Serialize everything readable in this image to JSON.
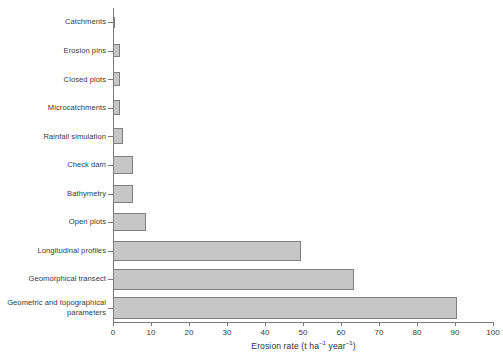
{
  "chart_data": {
    "type": "bar",
    "orientation": "horizontal",
    "title": "",
    "subtitle": "",
    "xlabel": "Erosion rate (t ha⁻¹ year⁻¹)",
    "xlabel_parts": {
      "lead": "Erosion rate (t ha",
      "sup1": "−1",
      "mid": " year",
      "sup2": "−1",
      "tail": ")"
    },
    "ylabel": "",
    "categories": [
      "Catchments",
      "Erosion pins",
      "Closed plots",
      "Microcatchments",
      "Rainfall simulation",
      "Check dam",
      "Bathymetry",
      "Open plots",
      "Longitudinal profiles",
      "Geomorphical transect",
      "Geometric and topographical parameters"
    ],
    "category_lines": [
      [
        "Catchments"
      ],
      [
        "Erosion pins"
      ],
      [
        "Closed plots"
      ],
      [
        "Microcatchments"
      ],
      [
        "Rainfall simulation"
      ],
      [
        "Check dam"
      ],
      [
        "Bathymetry"
      ],
      [
        "Open plots"
      ],
      [
        "Longitudinal profiles"
      ],
      [
        "Geomorphical transect"
      ],
      [
        "Geometric and topographical",
        "parameters"
      ]
    ],
    "values": [
      0.3,
      1.8,
      1.9,
      1.9,
      2.6,
      5.3,
      5.3,
      8.7,
      49.5,
      63.5,
      90.5
    ],
    "xlim": [
      0,
      100
    ],
    "xticks": [
      0,
      10,
      20,
      30,
      40,
      50,
      60,
      70,
      80,
      90,
      100
    ],
    "xticklabels": [
      "0",
      "10",
      "20",
      "30",
      "40",
      "50",
      "60",
      "70",
      "80",
      "90",
      "100"
    ],
    "grid": false,
    "legend": null,
    "bar_fill_color": "#c6c6c6",
    "bar_edge_color": "#808080",
    "axis_color": "#7a7a7a",
    "text_color": "#333333",
    "background_color": "#ffffff"
  }
}
